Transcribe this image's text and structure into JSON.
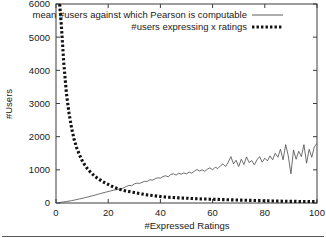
{
  "chart_data": {
    "type": "line",
    "title": "",
    "xlabel": "#Expressed Ratings",
    "ylabel": "#Users",
    "xlim": [
      0,
      100
    ],
    "ylim": [
      0,
      6000
    ],
    "xticks": [
      0,
      20,
      40,
      60,
      80,
      100
    ],
    "yticks": [
      0,
      1000,
      2000,
      3000,
      4000,
      5000,
      6000
    ],
    "xtick_labels": [
      "0",
      "20",
      "40",
      "60",
      "80",
      "100"
    ],
    "ytick_labels": [
      "0",
      "1000",
      "2000",
      "3000",
      "4000",
      "5000",
      "6000"
    ],
    "grid": false,
    "legend_position": "top-right-inside",
    "legend": [
      {
        "label": "mean #users against which Pearson is computable",
        "style": "solid-thin",
        "color": "#4a4a4a"
      },
      {
        "label": "#users expressing x ratings",
        "style": "dotted-thick",
        "color": "#111111"
      }
    ],
    "series": [
      {
        "name": "mean #users against which Pearson is computable",
        "style": "solid-thin",
        "color": "#4a4a4a",
        "x": [
          1,
          2,
          3,
          4,
          5,
          6,
          7,
          8,
          9,
          10,
          11,
          12,
          13,
          14,
          15,
          16,
          17,
          18,
          19,
          20,
          21,
          22,
          23,
          24,
          25,
          26,
          27,
          28,
          29,
          30,
          31,
          32,
          33,
          34,
          35,
          36,
          37,
          38,
          39,
          40,
          41,
          42,
          43,
          44,
          45,
          46,
          47,
          48,
          49,
          50,
          51,
          52,
          53,
          54,
          55,
          56,
          57,
          58,
          59,
          60,
          61,
          62,
          63,
          64,
          65,
          66,
          67,
          68,
          69,
          70,
          71,
          72,
          73,
          74,
          75,
          76,
          77,
          78,
          79,
          80,
          81,
          82,
          83,
          84,
          85,
          86,
          87,
          88,
          89,
          90,
          91,
          92,
          93,
          94,
          95,
          96,
          97,
          98,
          99,
          100
        ],
        "y": [
          10,
          20,
          32,
          45,
          58,
          72,
          88,
          105,
          122,
          140,
          158,
          178,
          198,
          218,
          240,
          262,
          285,
          305,
          325,
          345,
          365,
          385,
          400,
          415,
          430,
          460,
          500,
          530,
          520,
          575,
          600,
          590,
          625,
          655,
          650,
          700,
          690,
          730,
          760,
          750,
          800,
          820,
          790,
          860,
          880,
          840,
          900,
          870,
          905,
          880,
          930,
          900,
          960,
          1010,
          965,
          1000,
          955,
          1020,
          1060,
          1000,
          1080,
          1040,
          1120,
          1180,
          1100,
          1230,
          1400,
          1180,
          1290,
          1100,
          1320,
          1160,
          1390,
          1220,
          1280,
          1150,
          1300,
          1400,
          1230,
          1350,
          1270,
          1420,
          1300,
          1500,
          1380,
          1620,
          1300,
          1760,
          1420,
          880,
          1600,
          1320,
          1560,
          1400,
          1760,
          1200,
          1620,
          1380,
          1700,
          1800
        ]
      },
      {
        "name": "#users expressing x ratings",
        "style": "dotted-thick",
        "color": "#111111",
        "x": [
          1,
          2,
          3,
          4,
          5,
          6,
          7,
          8,
          9,
          10,
          11,
          12,
          13,
          14,
          15,
          16,
          17,
          18,
          19,
          20,
          21,
          22,
          23,
          24,
          25,
          26,
          27,
          28,
          29,
          30,
          31,
          32,
          33,
          34,
          35,
          36,
          37,
          38,
          39,
          40,
          41,
          42,
          43,
          44,
          45,
          46,
          47,
          48,
          49,
          50,
          51,
          52,
          53,
          54,
          55,
          56,
          57,
          58,
          59,
          60,
          61,
          62,
          63,
          64,
          65,
          66,
          67,
          68,
          69,
          70,
          71,
          72,
          73,
          74,
          75,
          76,
          77,
          78,
          79,
          80,
          81,
          82,
          83,
          84,
          85,
          86,
          87,
          88,
          89,
          90,
          91,
          92,
          93,
          94,
          95,
          96,
          97,
          98,
          99,
          100
        ],
        "y": [
          6400,
          5400,
          4200,
          3300,
          2700,
          2250,
          1900,
          1650,
          1450,
          1280,
          1150,
          1040,
          950,
          870,
          800,
          740,
          690,
          640,
          600,
          560,
          520,
          480,
          450,
          420,
          400,
          380,
          360,
          345,
          330,
          315,
          300,
          285,
          270,
          255,
          245,
          235,
          225,
          215,
          205,
          195,
          185,
          180,
          175,
          170,
          165,
          160,
          155,
          150,
          148,
          145,
          140,
          135,
          132,
          128,
          125,
          122,
          120,
          118,
          115,
          112,
          110,
          108,
          105,
          102,
          100,
          98,
          95,
          93,
          90,
          88,
          86,
          84,
          82,
          80,
          78,
          76,
          74,
          72,
          70,
          68,
          66,
          64,
          62,
          60,
          58,
          56,
          55,
          54,
          52,
          50,
          49,
          48,
          46,
          45,
          44,
          43,
          42,
          41,
          40,
          38
        ]
      }
    ]
  }
}
